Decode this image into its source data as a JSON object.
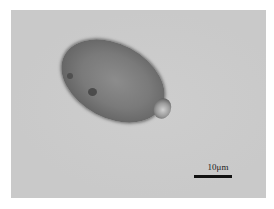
{
  "image": {
    "type": "micrograph",
    "background_color": "#c9c9c9",
    "border_color": "#ffffff"
  },
  "specimen": {
    "shape": "oval",
    "color": "#6e6e6e",
    "has_bud": true
  },
  "scale_bar": {
    "label": "10μm",
    "color": "#111111"
  }
}
